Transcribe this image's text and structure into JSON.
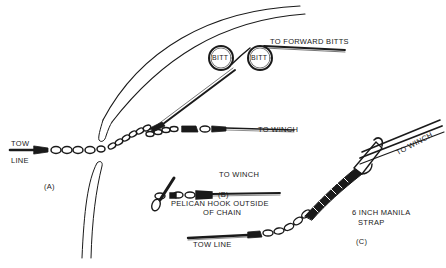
{
  "diagram": {
    "labels": {
      "to_forward_bitts": "TO FORWARD BITTS",
      "bitt_1": "BITT",
      "bitt_2": "BITT",
      "to_winch_a": "TO WINCH",
      "tow_line_a_1": "TOW",
      "tow_line_a_2": "LINE",
      "panel_a": "(A)",
      "to_winch_b": "TO WINCH",
      "panel_b": "(B)",
      "pelican_caption_1": "PELICAN HOOK OUTSIDE",
      "pelican_caption_2": "OF CHAIN",
      "tow_line_c": "TOW LINE",
      "manila_1": "6 INCH MANILA",
      "manila_2": "STRAP",
      "to_winch_c": "TO WINCH",
      "panel_c": "(C)"
    },
    "colors": {
      "ink": "#1a1a1a",
      "background": "#ffffff"
    }
  }
}
